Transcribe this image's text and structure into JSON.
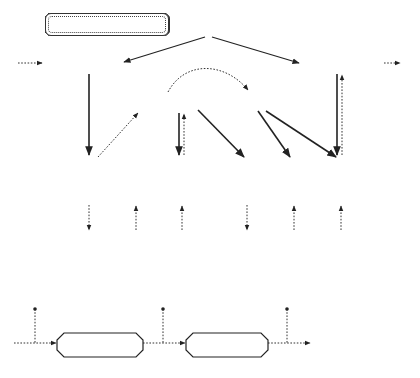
{
  "diagram": {
    "shared_data_section": {
      "components": {
        "master_control": "Master Control",
        "input": "Input",
        "output": "Output",
        "circular_shift": "Circular Shift",
        "alphabetize": "Alphabetize",
        "lines_ops": [
          "Insert",
          "Delete",
          "i-th"
        ],
        "shifted_ops": [
          "Insert",
          "Delete",
          "i-th"
        ],
        "lines_store": "Lines",
        "shifted_lines_store": "Shifted Lines"
      },
      "edges": [
        {
          "from": "Master Control",
          "to": "Input",
          "style": "solid"
        },
        {
          "from": "Master Control",
          "to": "Output",
          "style": "solid"
        },
        {
          "from": "external",
          "to": "Input",
          "style": "dotted"
        },
        {
          "from": "Output",
          "to": "external",
          "style": "dotted"
        },
        {
          "from": "Input",
          "to": "Lines.Insert",
          "style": "solid"
        },
        {
          "from": "Lines.Insert",
          "to": "Circular Shift",
          "style": "dotted"
        },
        {
          "from": "Circular Shift",
          "to": "Alphabetize",
          "style": "dotted-curve"
        },
        {
          "from": "Circular Shift",
          "to": "Lines.i-th",
          "style": "solid"
        },
        {
          "from": "Lines.i-th",
          "to": "Circular Shift",
          "style": "dotted"
        },
        {
          "from": "Circular Shift",
          "to": "Shifted.Insert",
          "style": "solid"
        },
        {
          "from": "Alphabetize",
          "to": "Shifted.Delete",
          "style": "solid"
        },
        {
          "from": "Alphabetize",
          "to": "Shifted.i-th",
          "style": "solid"
        },
        {
          "from": "Output",
          "to": "Shifted.i-th",
          "style": "solid"
        },
        {
          "from": "Shifted.i-th",
          "to": "Output",
          "style": "dotted"
        },
        {
          "from": "Lines.Insert",
          "to": "Lines",
          "style": "dotted"
        },
        {
          "from": "Lines",
          "to": "Lines.Delete",
          "style": "dotted"
        },
        {
          "from": "Lines",
          "to": "Lines.i-th",
          "style": "dotted"
        },
        {
          "from": "Shifted.Insert",
          "to": "Shifted Lines",
          "style": "dotted"
        },
        {
          "from": "Shifted Lines",
          "to": "Shifted.Delete",
          "style": "dotted"
        },
        {
          "from": "Shifted Lines",
          "to": "Shifted.i-th",
          "style": "dotted"
        }
      ]
    },
    "pipe_filter_section": {
      "title": "Pipe-and-Filter Architecture",
      "filters": [
        "Circular Shift",
        "Alphabetizer"
      ],
      "pipe_labels": [
        "Input Lines",
        "Shifted Lines",
        "Sorted, Shifted Lines"
      ]
    }
  }
}
